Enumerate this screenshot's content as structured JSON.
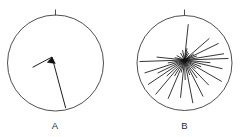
{
  "figure": {
    "width": 241,
    "height": 137,
    "background_color": "#ffffff",
    "line_color": "#121212",
    "outline_color": "#3a3a3a",
    "panel_count": 2
  },
  "panels": [
    {
      "id": "A",
      "label": "A",
      "label_x": 55,
      "label_y": 129,
      "circle": {
        "cx": 55.5,
        "cy": 63,
        "r": 48
      },
      "tick": {
        "x": 55.5,
        "y1": 9.5,
        "y2": 15.5,
        "orientation": "vertical-top"
      },
      "vertex": {
        "x": 52,
        "y": 57
      },
      "has_arrowhead": true,
      "arrowhead": {
        "x": 52,
        "y": 57,
        "size": 4.2,
        "direction_deg": 35
      },
      "spoke_count": 2,
      "chart_data": {
        "type": "scatter",
        "title": "A",
        "description": "Circle with two radial line segments converging at an interior vertex above-left of center; one short segment points up-left, one long segment reaches the lower circle boundary.",
        "center": [
          55.5,
          63
        ],
        "radius": 48,
        "vertex": [
          52,
          57
        ],
        "spokes": [
          {
            "name": "short-upper-left",
            "angle_deg": 208,
            "length": 22,
            "endpoint": [
              32.6,
              67.3
            ]
          },
          {
            "name": "long-lower-right",
            "angle_deg": 285,
            "length": 53,
            "endpoint": [
              65.7,
              108.8
            ]
          }
        ],
        "axis_tick_deg": 90,
        "grid": false
      }
    },
    {
      "id": "B",
      "label": "B",
      "label_x": 185,
      "label_y": 129,
      "circle": {
        "cx": 64.5,
        "cy": 63,
        "r": 47.5
      },
      "tick": {
        "x": 64.5,
        "y1": 9.5,
        "y2": 15.5,
        "orientation": "vertical-top"
      },
      "vertex": {
        "x": 64.5,
        "y": 60
      },
      "has_arrowhead": false,
      "spoke_count": 31,
      "chart_data": {
        "type": "scatter",
        "title": "B",
        "description": "Circle with a dense starburst of radial line segments of varying length emanating from a hub slightly above center; spokes concentrated toward the lower, left and right directions.",
        "center": [
          184.5,
          63
        ],
        "radius": 47.5,
        "hub": [
          184.5,
          60
        ],
        "axis_tick_deg": 90,
        "grid": false,
        "spokes": [
          {
            "angle_deg": 84,
            "length": 36
          },
          {
            "angle_deg": 78,
            "length": 12
          },
          {
            "angle_deg": 70,
            "length": 9
          },
          {
            "angle_deg": 58,
            "length": 8
          },
          {
            "angle_deg": 41,
            "length": 33
          },
          {
            "angle_deg": 33,
            "length": 11
          },
          {
            "angle_deg": 26,
            "length": 38
          },
          {
            "angle_deg": 18,
            "length": 13
          },
          {
            "angle_deg": 9,
            "length": 40
          },
          {
            "angle_deg": 2,
            "length": 44
          },
          {
            "angle_deg": 354,
            "length": 26
          },
          {
            "angle_deg": 347,
            "length": 39
          },
          {
            "angle_deg": 338,
            "length": 18
          },
          {
            "angle_deg": 330,
            "length": 43
          },
          {
            "angle_deg": 322,
            "length": 14
          },
          {
            "angle_deg": 314,
            "length": 35
          },
          {
            "angle_deg": 305,
            "length": 22
          },
          {
            "angle_deg": 297,
            "length": 41
          },
          {
            "angle_deg": 289,
            "length": 16
          },
          {
            "angle_deg": 281,
            "length": 44
          },
          {
            "angle_deg": 272,
            "length": 20
          },
          {
            "angle_deg": 264,
            "length": 38
          },
          {
            "angle_deg": 255,
            "length": 13
          },
          {
            "angle_deg": 247,
            "length": 42
          },
          {
            "angle_deg": 238,
            "length": 19
          },
          {
            "angle_deg": 230,
            "length": 45
          },
          {
            "angle_deg": 222,
            "length": 24
          },
          {
            "angle_deg": 214,
            "length": 44
          },
          {
            "angle_deg": 206,
            "length": 30
          },
          {
            "angle_deg": 198,
            "length": 42
          },
          {
            "angle_deg": 190,
            "length": 17
          },
          {
            "angle_deg": 182,
            "length": 45
          },
          {
            "angle_deg": 174,
            "length": 28
          },
          {
            "angle_deg": 166,
            "length": 10
          },
          {
            "angle_deg": 150,
            "length": 9
          },
          {
            "angle_deg": 120,
            "length": 8
          },
          {
            "angle_deg": 101,
            "length": 10
          }
        ]
      }
    }
  ]
}
